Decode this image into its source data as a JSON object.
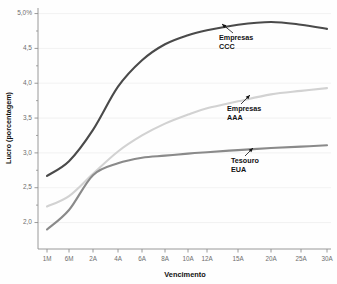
{
  "chart_data": {
    "type": "line",
    "title": "",
    "xlabel": "Vencimento",
    "ylabel": "Lucro (porcentagem)",
    "x_categories": [
      "1M",
      "6M",
      "2A",
      "4A",
      "6A",
      "8A",
      "10A",
      "12A",
      "15A",
      "20A",
      "25A",
      "30A"
    ],
    "y_tick_labels": [
      "5,0%",
      "4,5",
      "4,0",
      "3,5",
      "3,0",
      "2,5",
      "2,0"
    ],
    "y_tick_values": [
      5.0,
      4.5,
      4.0,
      3.5,
      3.0,
      2.5,
      2.0
    ],
    "ylim": [
      1.62,
      5.08
    ],
    "grid": "horizontal-light",
    "legend": "inline-annotations",
    "series": [
      {
        "name": "Empresas CCC",
        "label_line1": "Empresas",
        "label_line2": "CCC",
        "color": "#4a4a4a",
        "values": [
          2.67,
          2.88,
          3.33,
          3.95,
          4.33,
          4.56,
          4.69,
          4.76,
          4.84,
          4.88,
          4.84,
          4.78
        ]
      },
      {
        "name": "Empresas AAA",
        "label_line1": "Empresas",
        "label_line2": "AAA",
        "color": "#d2d2d2",
        "values": [
          2.23,
          2.38,
          2.7,
          3.02,
          3.25,
          3.42,
          3.55,
          3.64,
          3.74,
          3.84,
          3.89,
          3.93
        ]
      },
      {
        "name": "Tesouro EUA",
        "label_line1": "Tesouro",
        "label_line2": "EUA",
        "color": "#8a8a8a",
        "values": [
          1.9,
          2.18,
          2.68,
          2.85,
          2.93,
          2.96,
          2.99,
          3.01,
          3.04,
          3.07,
          3.09,
          3.11
        ]
      }
    ],
    "annotations": [
      {
        "series": "Empresas CCC",
        "text_line1": "Empresas",
        "text_line2": "CCC",
        "anchor_x": 222,
        "anchor_y": 24,
        "text_x": 219,
        "text_y": 40
      },
      {
        "series": "Empresas AAA",
        "text_line1": "Empresas",
        "text_line2": "AAA",
        "anchor_x": 250,
        "anchor_y": 95,
        "text_x": 227,
        "text_y": 111
      },
      {
        "series": "Tesouro EUA",
        "text_line1": "Tesouro",
        "text_line2": "EUA",
        "anchor_x": 253,
        "anchor_y": 148,
        "text_x": 231,
        "text_y": 163
      }
    ],
    "colors": {
      "axis": "#8e8e8e",
      "grid": "#ececec",
      "tick_text": "#6e6e6e",
      "title_text": "#111111",
      "background": "#fefefe"
    }
  }
}
